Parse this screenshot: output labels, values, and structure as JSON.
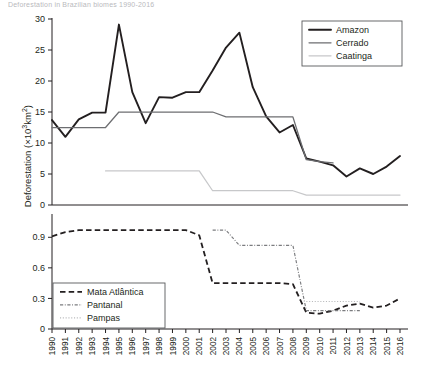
{
  "page": {
    "cut_header": "Deforestation in Brazilian biomes 1990-2016"
  },
  "axes": {
    "ylabel_main": "Deforestation",
    "ylabel_unit_pre": " (×10",
    "ylabel_unit_sup": "3",
    "ylabel_unit_post": "km",
    "ylabel_unit_sup2": "2",
    "ylabel_unit_end": ")"
  },
  "legend_top": {
    "items": [
      {
        "label": "Amazon",
        "color": "#231f20",
        "style": "solid-thick"
      },
      {
        "label": "Cerrado",
        "color": "#6d6e71",
        "style": "solid-medium"
      },
      {
        "label": "Caatinga",
        "color": "#c7c8ca",
        "style": "solid-light"
      }
    ]
  },
  "legend_bottom": {
    "items": [
      {
        "label": "Mata Atlântica",
        "color": "#231f20",
        "style": "dashed"
      },
      {
        "label": "Pantanal",
        "color": "#7b7c7f",
        "style": "dash-dot"
      },
      {
        "label": "Pampas",
        "color": "#b9babc",
        "style": "dotted"
      }
    ]
  },
  "chart_data": {
    "type": "line",
    "title": "",
    "xlabel": "",
    "ylabel": "Deforestation (×10³km²)",
    "grid": false,
    "legend_position": "top-right / mid-left",
    "x": [
      1990,
      1991,
      1992,
      1993,
      1994,
      1995,
      1996,
      1997,
      1998,
      1999,
      2000,
      2001,
      2002,
      2003,
      2004,
      2005,
      2006,
      2007,
      2008,
      2009,
      2010,
      2011,
      2012,
      2013,
      2014,
      2015,
      2016
    ],
    "xtick_labels": [
      "1990",
      "1991",
      "1992",
      "1993",
      "1994",
      "1995",
      "1996",
      "1997",
      "1998",
      "1999",
      "2000",
      "2001",
      "2002",
      "2003",
      "2004",
      "2005",
      "2006",
      "2007",
      "2008",
      "2009",
      "2010",
      "2011",
      "2012",
      "2013",
      "2014",
      "2015",
      "2016"
    ],
    "panels": [
      {
        "id": "top",
        "ylim": [
          0,
          30
        ],
        "yticks": [
          0,
          5,
          10,
          15,
          20,
          25,
          30
        ],
        "ytick_labels": [
          "0",
          "5",
          "10",
          "15",
          "20",
          "25",
          "30"
        ],
        "series": [
          {
            "name": "Amazon",
            "color": "#231f20",
            "style": "solid-thick",
            "values": [
              13.7,
              11.0,
              13.8,
              14.9,
              14.9,
              29.1,
              18.2,
              13.2,
              17.4,
              17.3,
              18.2,
              18.2,
              21.7,
              25.4,
              27.8,
              19.0,
              14.3,
              11.7,
              12.9,
              7.5,
              7.0,
              6.4,
              4.6,
              5.9,
              5.0,
              6.2,
              7.9
            ]
          },
          {
            "name": "Cerrado",
            "color": "#6d6e71",
            "style": "solid-medium",
            "values": [
              12.5,
              12.5,
              12.5,
              12.5,
              12.5,
              15.0,
              15.0,
              15.0,
              15.0,
              15.0,
              15.0,
              15.0,
              15.0,
              14.2,
              14.2,
              14.2,
              14.2,
              14.2,
              14.2,
              7.3,
              7.0,
              6.8,
              null,
              null,
              null,
              null,
              null
            ]
          },
          {
            "name": "Caatinga",
            "color": "#c7c8ca",
            "style": "solid-light",
            "values": [
              null,
              null,
              null,
              null,
              5.5,
              5.5,
              5.5,
              5.5,
              5.5,
              5.5,
              5.5,
              5.5,
              2.3,
              2.3,
              2.3,
              2.3,
              2.3,
              2.3,
              2.3,
              1.6,
              1.6,
              1.6,
              1.6,
              1.6,
              1.6,
              1.6,
              1.6
            ]
          }
        ]
      },
      {
        "id": "bottom",
        "ylim": [
          0,
          1.05
        ],
        "yticks": [
          0,
          0.3,
          0.6,
          0.9
        ],
        "ytick_labels": [
          "0",
          "0.3",
          "0.6",
          "0.9"
        ],
        "series": [
          {
            "name": "Mata Atlântica",
            "color": "#231f20",
            "style": "dashed",
            "values": [
              0.91,
              0.95,
              0.97,
              0.97,
              0.97,
              0.97,
              0.97,
              0.97,
              0.97,
              0.97,
              0.97,
              0.92,
              0.45,
              0.45,
              0.45,
              0.45,
              0.45,
              0.45,
              0.44,
              0.16,
              0.15,
              0.18,
              0.23,
              0.25,
              0.21,
              0.23,
              0.3
            ]
          },
          {
            "name": "Pantanal",
            "color": "#7b7c7f",
            "style": "dash-dot",
            "values": [
              null,
              null,
              null,
              null,
              null,
              null,
              null,
              null,
              null,
              null,
              null,
              null,
              0.97,
              0.97,
              0.82,
              0.82,
              0.82,
              0.82,
              0.82,
              0.18,
              0.18,
              0.18,
              0.18,
              0.18,
              null,
              null,
              null
            ]
          },
          {
            "name": "Pampas",
            "color": "#b9babc",
            "style": "dotted",
            "values": [
              null,
              null,
              null,
              null,
              null,
              null,
              null,
              null,
              null,
              null,
              null,
              null,
              null,
              null,
              null,
              null,
              null,
              null,
              null,
              0.27,
              0.27,
              0.27,
              0.27,
              0.27,
              null,
              null,
              null
            ]
          }
        ]
      }
    ]
  }
}
